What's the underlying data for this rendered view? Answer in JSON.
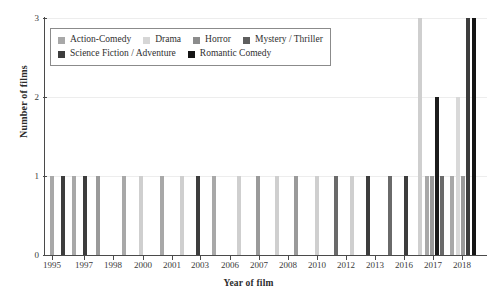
{
  "chart_data": {
    "type": "bar",
    "title": "",
    "xlabel": "Year of film",
    "ylabel": "Number of films",
    "ylim": [
      0,
      3
    ],
    "yticks": [
      0,
      1,
      2,
      3
    ],
    "grid": true,
    "legend_position": "top-left",
    "x_tick_labels": [
      "1995",
      "1997",
      "1998",
      "2000",
      "2001",
      "2003",
      "2006",
      "2007",
      "2008",
      "2010",
      "2012",
      "2013",
      "2016",
      "2017",
      "2018"
    ],
    "x_tick_positions": [
      52,
      84,
      113,
      143,
      172,
      200,
      230,
      259,
      288,
      317,
      346,
      375,
      404,
      433,
      462
    ],
    "series": [
      {
        "name": "Action-Comedy",
        "color": "#a8a8a8"
      },
      {
        "name": "Drama",
        "color": "#d6d6d6"
      },
      {
        "name": "Horror",
        "color": "#8c8c8c"
      },
      {
        "name": "Mystery / Thriller",
        "color": "#5e5e5e"
      },
      {
        "name": "Science Fiction / Adventure",
        "color": "#3d3d3d"
      },
      {
        "name": "Romantic Comedy",
        "color": "#151515"
      }
    ],
    "bars": [
      {
        "x": 52,
        "value": 1,
        "genre": "Action-Comedy",
        "color": "#a8a8a8"
      },
      {
        "x": 63,
        "value": 1,
        "genre": "Science Fiction / Adventure",
        "color": "#3d3d3d"
      },
      {
        "x": 74,
        "value": 1,
        "genre": "Action-Comedy",
        "color": "#a8a8a8"
      },
      {
        "x": 85,
        "value": 1,
        "genre": "Science Fiction / Adventure",
        "color": "#3d3d3d"
      },
      {
        "x": 98,
        "value": 1,
        "genre": "Horror",
        "color": "#9a9a9a"
      },
      {
        "x": 124,
        "value": 1,
        "genre": "Action-Comedy",
        "color": "#a8a8a8"
      },
      {
        "x": 141,
        "value": 1,
        "genre": "Drama",
        "color": "#cfcfcf"
      },
      {
        "x": 162,
        "value": 1,
        "genre": "Action-Comedy",
        "color": "#a8a8a8"
      },
      {
        "x": 182,
        "value": 1,
        "genre": "Drama",
        "color": "#cfcfcf"
      },
      {
        "x": 198,
        "value": 1,
        "genre": "Science Fiction / Adventure",
        "color": "#3d3d3d"
      },
      {
        "x": 214,
        "value": 1,
        "genre": "Action-Comedy",
        "color": "#a8a8a8"
      },
      {
        "x": 239,
        "value": 1,
        "genre": "Drama",
        "color": "#cfcfcf"
      },
      {
        "x": 258,
        "value": 1,
        "genre": "Horror",
        "color": "#9a9a9a"
      },
      {
        "x": 277,
        "value": 1,
        "genre": "Drama",
        "color": "#cfcfcf"
      },
      {
        "x": 296,
        "value": 1,
        "genre": "Horror",
        "color": "#9a9a9a"
      },
      {
        "x": 317,
        "value": 1,
        "genre": "Drama",
        "color": "#cfcfcf"
      },
      {
        "x": 336,
        "value": 1,
        "genre": "Mystery / Thriller",
        "color": "#6a6a6a"
      },
      {
        "x": 352,
        "value": 1,
        "genre": "Drama",
        "color": "#cfcfcf"
      },
      {
        "x": 368,
        "value": 1,
        "genre": "Science Fiction / Adventure",
        "color": "#3d3d3d"
      },
      {
        "x": 390,
        "value": 1,
        "genre": "Mystery / Thriller",
        "color": "#6a6a6a"
      },
      {
        "x": 406,
        "value": 1,
        "genre": "Science Fiction / Adventure",
        "color": "#3d3d3d"
      },
      {
        "x": 420,
        "value": 3,
        "genre": "Drama",
        "color": "#cfcfcf"
      },
      {
        "x": 427,
        "value": 1,
        "genre": "Action-Comedy",
        "color": "#a8a8a8"
      },
      {
        "x": 432,
        "value": 1,
        "genre": "Horror",
        "color": "#9a9a9a"
      },
      {
        "x": 437,
        "value": 2,
        "genre": "Romantic Comedy",
        "color": "#1c1c1c"
      },
      {
        "x": 442,
        "value": 1,
        "genre": "Mystery / Thriller",
        "color": "#6a6a6a"
      },
      {
        "x": 452,
        "value": 1,
        "genre": "Action-Comedy",
        "color": "#a8a8a8"
      },
      {
        "x": 458,
        "value": 2,
        "genre": "Drama",
        "color": "#d9d9d9"
      },
      {
        "x": 463,
        "value": 1,
        "genre": "Horror",
        "color": "#9a9a9a"
      },
      {
        "x": 468,
        "value": 3,
        "genre": "Science Fiction / Adventure",
        "color": "#3d3d3d"
      },
      {
        "x": 474,
        "value": 3,
        "genre": "Romantic Comedy",
        "color": "#151515"
      }
    ]
  }
}
